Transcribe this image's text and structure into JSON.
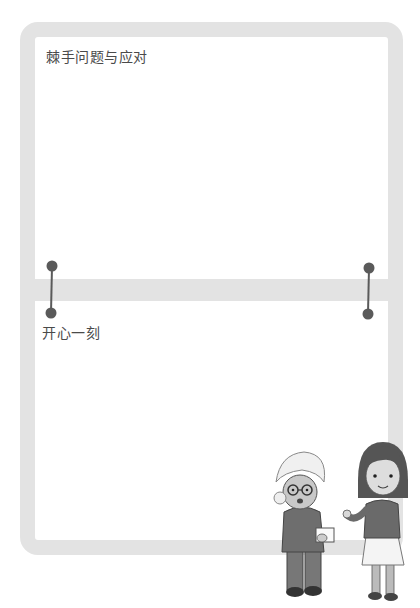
{
  "sections": [
    {
      "title": "棘手问题与应对"
    },
    {
      "title": "开心一刻"
    }
  ],
  "colors": {
    "frame": "#e3e3e3",
    "connector": "#5a5a5a",
    "text": "#4a4a4a"
  },
  "illustration": {
    "description": "grandmother handing a paper to a girl"
  }
}
